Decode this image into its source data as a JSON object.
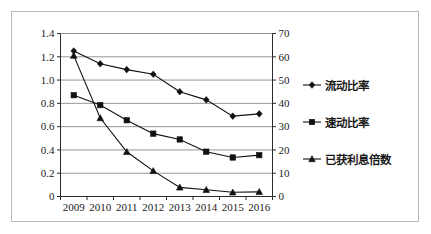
{
  "chart_data": {
    "type": "line",
    "title": "",
    "xlabel": "",
    "ylabel": "",
    "grid": true,
    "legend_position": "right",
    "categories": [
      "2009",
      "2010",
      "2011",
      "2012",
      "2013",
      "2014",
      "2015",
      "2016"
    ],
    "axes": {
      "left": {
        "label": "",
        "ylim": [
          0,
          1.4
        ],
        "ticks": [
          0,
          0.2,
          0.4,
          0.6,
          0.8,
          1.0,
          1.2,
          1.4
        ],
        "tick_labels": [
          "0",
          "0.2",
          "0.4",
          "0.6",
          "0.8",
          "1.0",
          "1.2",
          "1.4"
        ]
      },
      "right": {
        "label": "",
        "ylim": [
          0,
          70
        ],
        "ticks": [
          0,
          10,
          20,
          30,
          40,
          50,
          60,
          70
        ],
        "tick_labels": [
          "0",
          "10",
          "20",
          "30",
          "40",
          "50",
          "60",
          "70"
        ]
      }
    },
    "series": [
      {
        "name": "流动比率",
        "axis": "left",
        "marker": "diamond",
        "color": "#111111",
        "values": [
          1.25,
          1.14,
          1.09,
          1.05,
          0.9,
          0.83,
          0.69,
          0.71
        ]
      },
      {
        "name": "速动比率",
        "axis": "left",
        "marker": "square",
        "color": "#111111",
        "values": [
          0.87,
          0.785,
          0.655,
          0.54,
          0.49,
          0.385,
          0.335,
          0.355
        ]
      },
      {
        "name": "已获利息倍数",
        "axis": "right",
        "marker": "triangle",
        "color": "#111111",
        "values": [
          60.5,
          33.7,
          19.2,
          11.0,
          3.9,
          2.9,
          1.8,
          2.0
        ]
      }
    ]
  },
  "legend": {
    "items": [
      {
        "label": "流动比率",
        "marker": "diamond"
      },
      {
        "label": "速动比率",
        "marker": "square"
      },
      {
        "label": "已获利息倍数",
        "marker": "triangle"
      }
    ]
  },
  "colors": {
    "frame": "#b9b9b9",
    "axis": "#2b2b2b",
    "grid": "#8a8a8a",
    "ink": "#111111",
    "background": "#ffffff"
  }
}
